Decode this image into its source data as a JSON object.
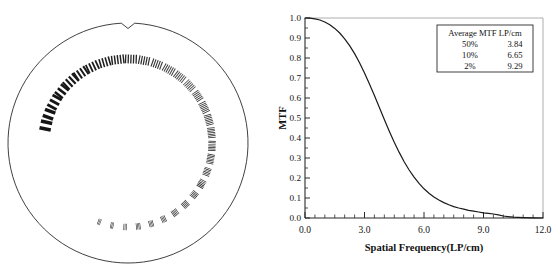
{
  "figure": {
    "panels": [
      "radial-bar-pattern-phantom",
      "mtf-plot"
    ]
  },
  "phantom": {
    "name": "Radial line-pair resolution test phantom",
    "outline_color": "#2b2b2b",
    "bar_color": "#1c1c1c",
    "notch_label": "orientation-notch",
    "groups": [
      {
        "index": 1,
        "angle_deg": 192,
        "bars": 2,
        "bar_w": 3.6,
        "gap": 3.2,
        "bar_h": 11.5,
        "gray": "#151515"
      },
      {
        "index": 2,
        "angle_deg": 200,
        "bars": 2,
        "bar_w": 3.4,
        "gap": 3.0,
        "bar_h": 11.0,
        "gray": "#151515"
      },
      {
        "index": 3,
        "angle_deg": 209,
        "bars": 3,
        "bar_w": 2.9,
        "gap": 2.5,
        "bar_h": 10.5,
        "gray": "#161616"
      },
      {
        "index": 4,
        "angle_deg": 218,
        "bars": 3,
        "bar_w": 2.6,
        "gap": 2.3,
        "bar_h": 10.0,
        "gray": "#171717"
      },
      {
        "index": 5,
        "angle_deg": 227,
        "bars": 4,
        "bar_w": 2.2,
        "gap": 2.0,
        "bar_h": 10.0,
        "gray": "#181818"
      },
      {
        "index": 6,
        "angle_deg": 236,
        "bars": 4,
        "bar_w": 2.0,
        "gap": 1.9,
        "bar_h": 9.6,
        "gray": "#1a1a1a"
      },
      {
        "index": 7,
        "angle_deg": 245,
        "bars": 4,
        "bar_w": 1.8,
        "gap": 1.7,
        "bar_h": 9.4,
        "gray": "#1c1c1c"
      },
      {
        "index": 8,
        "angle_deg": 254,
        "bars": 4,
        "bar_w": 1.6,
        "gap": 1.6,
        "bar_h": 9.2,
        "gray": "#1e1e1e"
      },
      {
        "index": 9,
        "angle_deg": 263,
        "bars": 5,
        "bar_w": 1.45,
        "gap": 1.45,
        "bar_h": 9.0,
        "gray": "#222222"
      },
      {
        "index": 10,
        "angle_deg": 272,
        "bars": 5,
        "bar_w": 1.3,
        "gap": 1.35,
        "bar_h": 8.8,
        "gray": "#272727"
      },
      {
        "index": 11,
        "angle_deg": 281,
        "bars": 5,
        "bar_w": 1.2,
        "gap": 1.25,
        "bar_h": 8.6,
        "gray": "#2e2e2e"
      },
      {
        "index": 12,
        "angle_deg": 290,
        "bars": 5,
        "bar_w": 1.1,
        "gap": 1.2,
        "bar_h": 8.4,
        "gray": "#353535"
      },
      {
        "index": 13,
        "angle_deg": 299,
        "bars": 6,
        "bar_w": 1.0,
        "gap": 1.1,
        "bar_h": 8.2,
        "gray": "#3c3c3c"
      },
      {
        "index": 14,
        "angle_deg": 308,
        "bars": 6,
        "bar_w": 0.95,
        "gap": 1.05,
        "bar_h": 8.0,
        "gray": "#444444"
      },
      {
        "index": 15,
        "angle_deg": 317,
        "bars": 6,
        "bar_w": 0.9,
        "gap": 1.0,
        "bar_h": 8.0,
        "gray": "#4a4a4a"
      },
      {
        "index": 16,
        "angle_deg": 326,
        "bars": 6,
        "bar_w": 0.85,
        "gap": 0.95,
        "bar_h": 7.8,
        "gray": "#3e3e3e"
      },
      {
        "index": 17,
        "angle_deg": 335,
        "bars": 7,
        "bar_w": 0.8,
        "gap": 0.9,
        "bar_h": 7.8,
        "gray": "#343434"
      },
      {
        "index": 18,
        "angle_deg": 344,
        "bars": 7,
        "bar_w": 0.78,
        "gap": 0.88,
        "bar_h": 7.6,
        "gray": "#2c2c2c"
      },
      {
        "index": 19,
        "angle_deg": 353,
        "bars": 7,
        "bar_w": 0.75,
        "gap": 0.85,
        "bar_h": 7.6,
        "gray": "#262626"
      },
      {
        "index": 20,
        "angle_deg": 2,
        "bars": 7,
        "bar_w": 0.72,
        "gap": 0.83,
        "bar_h": 7.4,
        "gray": "#222222"
      },
      {
        "index": 21,
        "angle_deg": 11,
        "bars": 7,
        "bar_w": 0.7,
        "gap": 0.8,
        "bar_h": 7.4,
        "gray": "#1f1f1f"
      },
      {
        "index": 22,
        "angle_deg": 20,
        "bars": 6,
        "bar_w": 0.68,
        "gap": 0.8,
        "bar_h": 7.2,
        "gray": "#1d1d1d"
      },
      {
        "index": 23,
        "angle_deg": 29,
        "bars": 6,
        "bar_w": 0.66,
        "gap": 0.78,
        "bar_h": 7.2,
        "gray": "#1c1c1c"
      },
      {
        "index": 24,
        "angle_deg": 38,
        "bars": 5,
        "bar_w": 0.64,
        "gap": 0.78,
        "bar_h": 7.0,
        "gray": "#1b1b1b"
      },
      {
        "index": 25,
        "angle_deg": 47,
        "bars": 5,
        "bar_w": 0.62,
        "gap": 0.76,
        "bar_h": 7.0,
        "gray": "#1a1a1a"
      },
      {
        "index": 26,
        "angle_deg": 56,
        "bars": 5,
        "bar_w": 0.6,
        "gap": 0.75,
        "bar_h": 6.8,
        "gray": "#1a1a1a"
      },
      {
        "index": 27,
        "angle_deg": 65,
        "bars": 4,
        "bar_w": 0.58,
        "gap": 0.74,
        "bar_h": 6.8,
        "gray": "#191919"
      },
      {
        "index": 28,
        "angle_deg": 74,
        "bars": 4,
        "bar_w": 0.56,
        "gap": 0.72,
        "bar_h": 6.6,
        "gray": "#191919"
      },
      {
        "index": 29,
        "angle_deg": 83,
        "bars": 4,
        "bar_w": 0.55,
        "gap": 0.72,
        "bar_h": 6.6,
        "gray": "#181818"
      },
      {
        "index": 30,
        "angle_deg": 92,
        "bars": 3,
        "bar_w": 0.54,
        "gap": 0.7,
        "bar_h": 6.4,
        "gray": "#181818"
      },
      {
        "index": 31,
        "angle_deg": 101,
        "bars": 3,
        "bar_w": 0.52,
        "gap": 0.7,
        "bar_h": 6.4,
        "gray": "#171717"
      },
      {
        "index": 32,
        "angle_deg": 110,
        "bars": 3,
        "bar_w": 0.5,
        "gap": 0.68,
        "bar_h": 6.2,
        "gray": "#171717"
      }
    ]
  },
  "chart_data": {
    "type": "line",
    "title": "",
    "xlabel": "Spatial Frequency(LP/cm)",
    "ylabel": "MTF",
    "xlim": [
      0.0,
      12.0
    ],
    "ylim": [
      0.0,
      1.0
    ],
    "grid": false,
    "legend_position": "top-right",
    "xticks": [
      0.0,
      3.0,
      6.0,
      9.0,
      12.0
    ],
    "xtick_labels": [
      "0.0",
      "3.0",
      "6.0",
      "9.0",
      "12.0"
    ],
    "x_minor_tick_step": 0.5,
    "yticks": [
      0.0,
      0.1,
      0.2,
      0.3,
      0.4,
      0.5,
      0.6,
      0.7,
      0.8,
      0.9,
      1.0
    ],
    "ytick_labels": [
      "0.0",
      "0.1",
      "0.2",
      "0.3",
      "0.4",
      "0.5",
      "0.6",
      "0.7",
      "0.8",
      "0.9",
      "1.0"
    ],
    "series": [
      {
        "name": "MTF",
        "color": "#1a1a1a",
        "x": [
          0.0,
          0.25,
          0.5,
          0.75,
          1.0,
          1.25,
          1.5,
          1.75,
          2.0,
          2.25,
          2.5,
          2.75,
          3.0,
          3.25,
          3.5,
          3.75,
          4.0,
          4.25,
          4.5,
          4.75,
          5.0,
          5.25,
          5.5,
          5.75,
          6.0,
          6.25,
          6.5,
          6.75,
          7.0,
          7.25,
          7.5,
          7.75,
          8.0,
          8.25,
          8.5,
          8.75,
          9.0,
          9.25,
          9.5,
          9.75,
          10.0,
          10.5,
          11.0,
          11.5,
          12.0
        ],
        "y": [
          1.0,
          0.999,
          0.996,
          0.99,
          0.98,
          0.966,
          0.948,
          0.925,
          0.896,
          0.862,
          0.822,
          0.776,
          0.725,
          0.67,
          0.612,
          0.552,
          0.492,
          0.434,
          0.379,
          0.328,
          0.281,
          0.24,
          0.204,
          0.173,
          0.146,
          0.124,
          0.105,
          0.09,
          0.077,
          0.066,
          0.057,
          0.05,
          0.044,
          0.038,
          0.034,
          0.03,
          0.026,
          0.023,
          0.02,
          0.016,
          0.01,
          0.004,
          0.002,
          0.001,
          0.0
        ]
      }
    ]
  },
  "legend": {
    "header": "Average MTF LP/cm",
    "rows": [
      {
        "percent": "50%",
        "value": "3.84"
      },
      {
        "percent": "10%",
        "value": "6.65"
      },
      {
        "percent": "2%",
        "value": "9.29"
      }
    ]
  }
}
